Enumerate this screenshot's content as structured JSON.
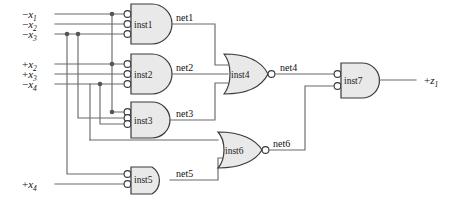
{
  "diagram": {
    "background_color": "#ffffff",
    "wire_color": "#6b6b6b",
    "gate_fill": "#e9e9e9",
    "gate_stroke": "#3a3a3a"
  },
  "inputs": [
    {
      "id": "in-x1",
      "sign": "−",
      "base": "x",
      "index": "1",
      "label": "−x₁",
      "y": 14
    },
    {
      "id": "in-x2n",
      "sign": "−",
      "base": "x",
      "index": "2",
      "label": "−x₂",
      "y": 24
    },
    {
      "id": "in-x3n",
      "sign": "−",
      "base": "x",
      "index": "3",
      "label": "−x₃",
      "y": 34
    },
    {
      "id": "in-x2p",
      "sign": "+",
      "base": "x",
      "index": "2",
      "label": "+x₂",
      "y": 64
    },
    {
      "id": "in-x3p",
      "sign": "+",
      "base": "x",
      "index": "3",
      "label": "+x₃",
      "y": 74
    },
    {
      "id": "in-x4n",
      "sign": "−",
      "base": "x",
      "index": "4",
      "label": "−x₄",
      "y": 84
    },
    {
      "id": "in-x4p",
      "sign": "+",
      "base": "x",
      "index": "4",
      "label": "+x₄",
      "y": 184
    }
  ],
  "outputs": [
    {
      "id": "out-z1",
      "sign": "+",
      "base": "z",
      "index": "1",
      "label": "+z₁"
    }
  ],
  "gates": [
    {
      "id": "inst1",
      "label": "inst1",
      "type": "and",
      "inverted_inputs": true,
      "inverted_output": false,
      "num_inputs": 3
    },
    {
      "id": "inst2",
      "label": "inst2",
      "type": "and",
      "inverted_inputs": true,
      "inverted_output": false,
      "num_inputs": 3
    },
    {
      "id": "inst3",
      "label": "inst3",
      "type": "and",
      "inverted_inputs": true,
      "inverted_output": false,
      "num_inputs": 3
    },
    {
      "id": "inst4",
      "label": "inst4",
      "type": "nor",
      "inverted_inputs": false,
      "inverted_output": true,
      "num_inputs": 3
    },
    {
      "id": "inst5",
      "label": "inst5",
      "type": "and",
      "inverted_inputs": true,
      "inverted_output": false,
      "num_inputs": 2
    },
    {
      "id": "inst6",
      "label": "inst6",
      "type": "nor",
      "inverted_inputs": false,
      "inverted_output": true,
      "num_inputs": 2
    },
    {
      "id": "inst7",
      "label": "inst7",
      "type": "and",
      "inverted_inputs": true,
      "inverted_output": false,
      "num_inputs": 2
    }
  ],
  "nets": [
    {
      "id": "net1",
      "label": "net1",
      "source": "inst1",
      "targets": [
        "inst4"
      ]
    },
    {
      "id": "net2",
      "label": "net2",
      "source": "inst2",
      "targets": [
        "inst4"
      ]
    },
    {
      "id": "net3",
      "label": "net3",
      "source": "inst3",
      "targets": [
        "inst4"
      ]
    },
    {
      "id": "net4",
      "label": "net4",
      "source": "inst4",
      "targets": [
        "inst7"
      ]
    },
    {
      "id": "net5",
      "label": "net5",
      "source": "inst5",
      "targets": [
        "inst6"
      ]
    },
    {
      "id": "net6",
      "label": "net6",
      "source": "inst6",
      "targets": [
        "inst7"
      ]
    }
  ]
}
